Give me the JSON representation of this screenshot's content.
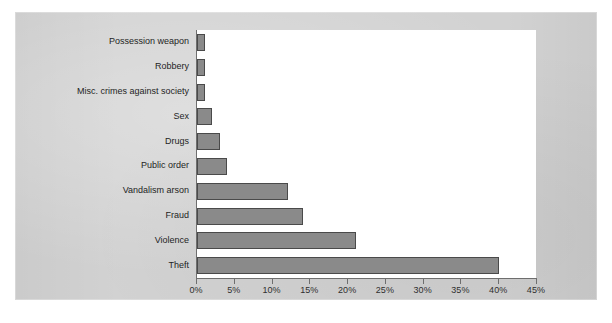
{
  "figure": {
    "panel_background": "#d2d2d2",
    "plot_background": "#ffffff",
    "axis_color": "#6e6e6e",
    "bar_fill": "#8a8a8a",
    "bar_stroke": "#4a4a4a"
  },
  "chart_data": {
    "type": "bar",
    "orientation": "horizontal",
    "title": "",
    "subtitle": "",
    "xlabel": "",
    "ylabel": "",
    "categories": [
      "Possession weapon",
      "Robbery",
      "Misc. crimes against society",
      "Sex",
      "Drugs",
      "Public order",
      "Vandalism arson",
      "Fraud",
      "Violence",
      "Theft"
    ],
    "values": [
      1,
      1,
      1,
      2,
      3,
      4,
      12,
      14,
      21,
      40
    ],
    "value_unit": "%",
    "xlim": [
      0,
      45
    ],
    "xticks": [
      0,
      5,
      10,
      15,
      20,
      25,
      30,
      35,
      40,
      45
    ],
    "xtick_labels": [
      "0%",
      "5%",
      "10%",
      "15%",
      "20%",
      "25%",
      "30%",
      "35%",
      "40%",
      "45%"
    ],
    "grid": false,
    "legend": null,
    "legend_position": "none",
    "annotations": []
  }
}
